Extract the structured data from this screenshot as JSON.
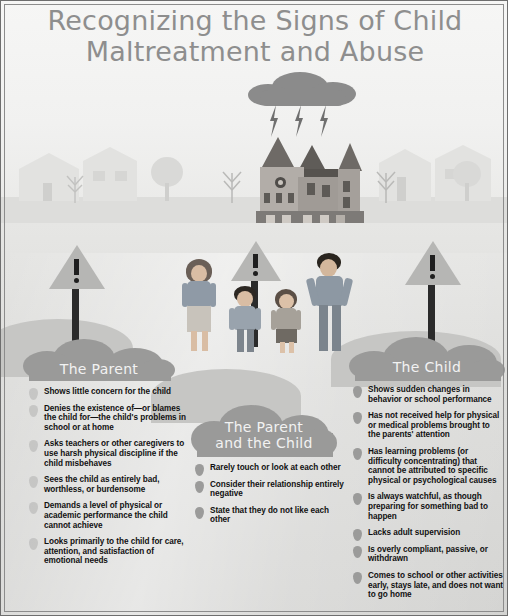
{
  "poster": {
    "title_line1": "Recognizing the Signs of Child",
    "title_line2": "Maltreatment and Abuse",
    "colors": {
      "sky": "#f3f3f2",
      "ground": "#dcdcda",
      "cloud_header": "#9a9a99",
      "title_text": "#8e8e8e",
      "body_text": "#111111",
      "storm_cloud": "#8b8b8b",
      "lightning": "#6f6f6f",
      "sign_plate": "#b6b6b4",
      "sign_post": "#2b2b2b",
      "hill": "#c6c6c4"
    }
  },
  "scene": {
    "storm_cloud": "storm-cloud-icon",
    "lightning_bolt_count": 3,
    "main_house": "victorian-house-illustration",
    "background_houses": 4,
    "trees": 4,
    "warning_signs": 3,
    "warning_sign_glyph": "!",
    "people": [
      {
        "name": "mother-figure",
        "role": "parent"
      },
      {
        "name": "boy-figure",
        "role": "child"
      },
      {
        "name": "girl-figure",
        "role": "child"
      },
      {
        "name": "father-figure",
        "role": "parent"
      }
    ]
  },
  "columns": [
    {
      "id": "the-parent",
      "heading_lines": [
        "The Parent"
      ],
      "items": [
        "Shows little concern for the child",
        "Denies the existence of—or blames the child for—the child's problems in school or at home",
        "Asks teachers or other caregivers to use harsh physical discipline if the child misbehaves",
        "Sees the child as entirely bad, worthless, or burdensome",
        "Demands a level of physical or academic performance the child cannot achieve",
        "Looks primarily to the child for care, attention, and satisfaction of emotional needs"
      ]
    },
    {
      "id": "the-parent-and-the-child",
      "heading_lines": [
        "The Parent",
        "and the Child"
      ],
      "items": [
        "Rarely touch or look at each other",
        "Consider their relationship entirely negative",
        "State that they do not like each other"
      ]
    },
    {
      "id": "the-child",
      "heading_lines": [
        "The Child"
      ],
      "items": [
        "Shows sudden changes in behavior or school performance",
        "Has not received help for physical or medical problems brought to the parents' attention",
        "Has learning problems (or difficulty concentrating) that cannot be attributed to specific physical or psychological causes",
        "Is always watchful, as though preparing for something bad to happen",
        "Lacks adult supervision",
        "Is overly compliant, passive, or withdrawn",
        "Comes to school or other activities early, stays late, and does not want to go home"
      ]
    }
  ]
}
